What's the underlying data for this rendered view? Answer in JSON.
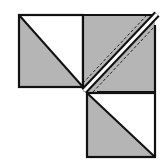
{
  "diagram": {
    "colors": {
      "fill_gray": "#b5b5b5",
      "fill_white": "#ffffff",
      "outline": "#111111",
      "background": "#ffffff"
    },
    "pieces": [
      {
        "id": "top-left-square",
        "description": "Half-square triangle: white upper-right, gray lower-left"
      },
      {
        "id": "top-right-square",
        "description": "Gray square cut along diagonal with white seam band and dashed stitching lines"
      },
      {
        "id": "bottom-right-square",
        "description": "Half-square triangle: white upper-right, gray lower-left"
      }
    ]
  }
}
